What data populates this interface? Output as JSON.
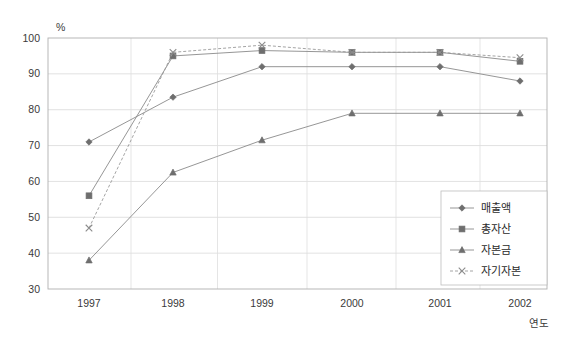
{
  "chart_data": {
    "type": "line",
    "title": "",
    "xlabel": "연도",
    "ylabel": "%",
    "x": [
      "1997",
      "1998",
      "1999",
      "2000",
      "2001",
      "2002"
    ],
    "categories": [
      "1997",
      "1998",
      "1999",
      "2000",
      "2001",
      "2002"
    ],
    "ylim": [
      30,
      100
    ],
    "yticks": [
      30,
      40,
      50,
      60,
      70,
      80,
      90,
      100
    ],
    "ytick_labels": [
      "30",
      "40",
      "50",
      "60",
      "70",
      "80",
      "90",
      "100"
    ],
    "grid": true,
    "legend_position": "inside-bottom-right",
    "series": [
      {
        "name": "매출액",
        "marker": "diamond",
        "line_style": "solid",
        "color": "#7d7d7d",
        "values": [
          71,
          83.5,
          92,
          92,
          92,
          88
        ]
      },
      {
        "name": "총자산",
        "marker": "square",
        "line_style": "solid",
        "color": "#7d7d7d",
        "values": [
          56,
          95,
          96.5,
          96,
          96,
          93.5
        ]
      },
      {
        "name": "자본금",
        "marker": "triangle",
        "line_style": "solid",
        "color": "#7d7d7d",
        "values": [
          38,
          62.5,
          71.5,
          79,
          79,
          79
        ]
      },
      {
        "name": "자기자본",
        "marker": "x",
        "line_style": "dashed",
        "color": "#8c8c8c",
        "values": [
          47,
          96,
          98,
          96,
          96,
          94.5
        ]
      }
    ]
  },
  "axes": {
    "y_unit_label": "%",
    "x_axis_title": "연도"
  },
  "legend": {
    "items": [
      {
        "label": "매출액"
      },
      {
        "label": "총자산"
      },
      {
        "label": "자본금"
      },
      {
        "label": "자기자본"
      }
    ]
  },
  "colors": {
    "line": "#8a8a8a",
    "marker": "#6e6e6e",
    "gridline": "#d9d9d9",
    "frame": "#b0b0b0",
    "background": "#ffffff"
  }
}
